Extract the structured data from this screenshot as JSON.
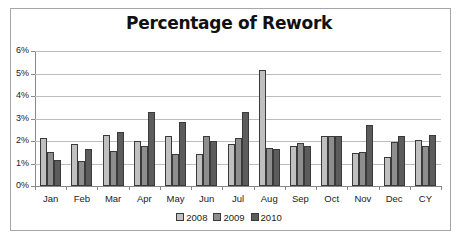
{
  "chart_data": {
    "type": "bar",
    "title": "Percentage of Rework",
    "xlabel": "",
    "ylabel": "",
    "ylim": [
      0,
      6
    ],
    "yticks": [
      "0%",
      "1%",
      "2%",
      "3%",
      "4%",
      "5%",
      "6%"
    ],
    "grid": true,
    "legend_position": "bottom",
    "categories": [
      "Jan",
      "Feb",
      "Mar",
      "Apr",
      "May",
      "Jun",
      "Jul",
      "Aug",
      "Sep",
      "Oct",
      "Nov",
      "Dec",
      "CY"
    ],
    "series": [
      {
        "name": "2008",
        "color": "#c0c0c0",
        "values": [
          2.13,
          1.87,
          2.27,
          2.0,
          2.22,
          1.42,
          1.87,
          5.15,
          1.78,
          2.22,
          1.47,
          1.29,
          2.04
        ]
      },
      {
        "name": "2009",
        "color": "#8e8e8e",
        "values": [
          1.51,
          1.11,
          1.56,
          1.78,
          1.42,
          2.22,
          2.13,
          1.69,
          1.91,
          2.22,
          1.51,
          1.96,
          1.78
        ]
      },
      {
        "name": "2010",
        "color": "#5c5c5c",
        "values": [
          1.16,
          1.64,
          2.4,
          3.29,
          2.84,
          2.0,
          3.29,
          1.64,
          1.78,
          2.22,
          2.71,
          2.22,
          2.27
        ]
      }
    ]
  }
}
